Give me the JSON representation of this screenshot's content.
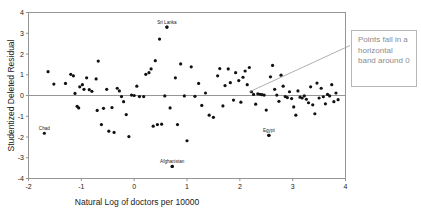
{
  "figure": {
    "type": "scatter-residual-plot",
    "background_color": "#ffffff",
    "frame_color": "#8a8a8a",
    "point_color": "#111111",
    "zero_line_color": "#8a8a8a"
  },
  "annotation": {
    "text": "Points fall in a horizontal band around 0",
    "border_color": "#b6b6b6",
    "text_color": "#8c8c8c",
    "leader_color": "#9a9a9a"
  },
  "chart_data": {
    "type": "scatter",
    "title": "",
    "xlabel": "Natural Log of doctors per 10000",
    "ylabel": "Studentized Deleted Residual",
    "xlim": [
      -2,
      4
    ],
    "ylim": [
      -4,
      4
    ],
    "xticks": [
      -2,
      -1,
      0,
      1,
      2,
      3,
      4
    ],
    "xticklabels": [
      "-2",
      "-1",
      "0",
      "1",
      "2",
      "3",
      "4"
    ],
    "yticks": [
      -4,
      -3,
      -2,
      -1,
      0,
      1,
      2,
      3,
      4
    ],
    "yticklabels": [
      "-4",
      "-3",
      "-2",
      "-1",
      "0",
      "1",
      "2",
      "3",
      "4"
    ],
    "grid": false,
    "legend": null,
    "reference_lines": [
      {
        "axis": "y",
        "value": 0
      }
    ],
    "marker": "circle",
    "marker_size": 1.6,
    "annotations": [
      {
        "label": "Sri Lanka",
        "x": 0.62,
        "y": 3.3
      },
      {
        "label": "Chad",
        "x": -1.7,
        "y": -1.82
      },
      {
        "label": "Afghanistan",
        "x": 0.72,
        "y": -3.42
      },
      {
        "label": "Egypt",
        "x": 2.55,
        "y": -1.92
      }
    ],
    "points": [
      [
        -1.63,
        1.15
      ],
      [
        -1.52,
        0.55
      ],
      [
        -1.3,
        0.58
      ],
      [
        -1.2,
        1.02
      ],
      [
        -1.15,
        0.95
      ],
      [
        -1.12,
        0.1
      ],
      [
        -1.08,
        -0.52
      ],
      [
        -1.05,
        -0.6
      ],
      [
        -1.03,
        0.42
      ],
      [
        -0.98,
        0.52
      ],
      [
        -0.95,
        0.3
      ],
      [
        -0.9,
        0.85
      ],
      [
        -0.85,
        0.28
      ],
      [
        -0.8,
        0.2
      ],
      [
        -0.72,
        0.8
      ],
      [
        -0.7,
        -0.72
      ],
      [
        -0.68,
        1.66
      ],
      [
        -0.62,
        -1.4
      ],
      [
        -0.58,
        -0.62
      ],
      [
        -0.52,
        0.3
      ],
      [
        -0.48,
        -1.72
      ],
      [
        -0.42,
        -0.58
      ],
      [
        -0.38,
        -1.78
      ],
      [
        -0.32,
        0.35
      ],
      [
        -0.28,
        0.22
      ],
      [
        -0.24,
        -0.05
      ],
      [
        -0.2,
        -0.3
      ],
      [
        -0.15,
        -0.92
      ],
      [
        -0.1,
        -1.98
      ],
      [
        -0.05,
        0.02
      ],
      [
        0.0,
        0.0
      ],
      [
        0.05,
        0.45
      ],
      [
        0.1,
        -0.05
      ],
      [
        0.18,
        -0.05
      ],
      [
        0.22,
        1.02
      ],
      [
        0.28,
        1.1
      ],
      [
        0.32,
        1.28
      ],
      [
        0.36,
        -1.48
      ],
      [
        0.4,
        1.68
      ],
      [
        0.44,
        -1.4
      ],
      [
        0.48,
        2.72
      ],
      [
        0.52,
        -1.38
      ],
      [
        0.58,
        -0.02
      ],
      [
        0.62,
        3.3
      ],
      [
        0.68,
        -0.6
      ],
      [
        0.72,
        -3.42
      ],
      [
        0.78,
        0.85
      ],
      [
        0.82,
        -1.4
      ],
      [
        0.88,
        1.52
      ],
      [
        0.95,
        -0.02
      ],
      [
        1.0,
        -2.18
      ],
      [
        1.08,
        1.38
      ],
      [
        1.15,
        -0.04
      ],
      [
        1.22,
        0.58
      ],
      [
        1.28,
        -0.48
      ],
      [
        1.35,
        0.12
      ],
      [
        1.42,
        -0.95
      ],
      [
        1.5,
        -1.05
      ],
      [
        1.58,
        0.95
      ],
      [
        1.62,
        1.3
      ],
      [
        1.68,
        -0.5
      ],
      [
        1.72,
        0.48
      ],
      [
        1.78,
        1.28
      ],
      [
        1.82,
        0.62
      ],
      [
        1.88,
        -0.22
      ],
      [
        1.92,
        1.1
      ],
      [
        1.98,
        0.72
      ],
      [
        2.02,
        -0.32
      ],
      [
        2.06,
        0.88
      ],
      [
        2.1,
        1.18
      ],
      [
        2.14,
        0.52
      ],
      [
        2.18,
        1.35
      ],
      [
        2.22,
        0.18
      ],
      [
        2.26,
        0.05
      ],
      [
        2.3,
        -0.42
      ],
      [
        2.34,
        0.08
      ],
      [
        2.38,
        0.06
      ],
      [
        2.42,
        0.04
      ],
      [
        2.46,
        0.02
      ],
      [
        2.5,
        -0.7
      ],
      [
        2.55,
        -1.92
      ],
      [
        2.58,
        0.9
      ],
      [
        2.62,
        1.45
      ],
      [
        2.66,
        0.3
      ],
      [
        2.7,
        0.02
      ],
      [
        2.74,
        -0.28
      ],
      [
        2.78,
        0.98
      ],
      [
        2.82,
        0.45
      ],
      [
        2.86,
        -0.05
      ],
      [
        2.9,
        -0.1
      ],
      [
        2.94,
        0.18
      ],
      [
        2.98,
        -0.15
      ],
      [
        3.02,
        -0.55
      ],
      [
        3.06,
        -0.95
      ],
      [
        3.1,
        0.22
      ],
      [
        3.14,
        -0.08
      ],
      [
        3.18,
        -0.12
      ],
      [
        3.22,
        -0.02
      ],
      [
        3.26,
        -0.18
      ],
      [
        3.3,
        -0.35
      ],
      [
        3.34,
        0.42
      ],
      [
        3.38,
        -0.45
      ],
      [
        3.42,
        -0.88
      ],
      [
        3.46,
        0.6
      ],
      [
        3.5,
        -0.12
      ],
      [
        3.54,
        0.35
      ],
      [
        3.58,
        -0.06
      ],
      [
        3.62,
        -0.4
      ],
      [
        3.66,
        0.05
      ],
      [
        3.7,
        -0.02
      ],
      [
        3.74,
        0.52
      ],
      [
        3.78,
        -0.3
      ],
      [
        3.82,
        0.12
      ],
      [
        3.86,
        -0.2
      ]
    ]
  }
}
